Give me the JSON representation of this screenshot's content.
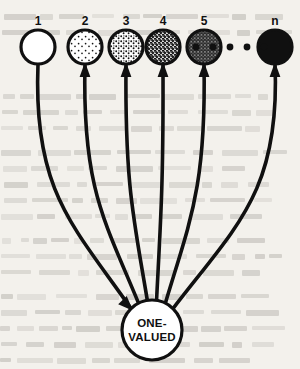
{
  "figure": {
    "background_color": "#f3f1ec",
    "ink_color": "#101010",
    "width": 300,
    "height": 369
  },
  "center_node": {
    "name": "one-valued-node",
    "label_line1": "ONE-",
    "label_line2": "VALUED",
    "cx": 152,
    "cy": 330,
    "r": 30,
    "fill": "#ffffff"
  },
  "ellipsis": {
    "name": "ellipsis-dots",
    "count": 5,
    "dot_radius": 3.4,
    "cy": 47,
    "xs": [
      196,
      213,
      230,
      247,
      264
    ]
  },
  "nodes": [
    {
      "label": "1",
      "cx": 38,
      "cy": 47,
      "r": 17,
      "shade": 0,
      "fill": "#ffffff",
      "arrow_at_node": false,
      "arrow_at_center": true
    },
    {
      "label": "2",
      "cx": 85,
      "cy": 47,
      "r": 17,
      "shade": 1,
      "fill": "#f2efe8",
      "arrow_at_node": true,
      "arrow_at_center": false
    },
    {
      "label": "3",
      "cx": 126,
      "cy": 47,
      "r": 17,
      "shade": 2,
      "fill": "#cfcabe",
      "arrow_at_node": true,
      "arrow_at_center": false
    },
    {
      "label": "4",
      "cx": 163,
      "cy": 47,
      "r": 17,
      "shade": 3,
      "fill": "#8d877c",
      "arrow_at_node": true,
      "arrow_at_center": false
    },
    {
      "label": "5",
      "cx": 204,
      "cy": 47,
      "r": 17,
      "shade": 4,
      "fill": "#4a463f",
      "arrow_at_node": true,
      "arrow_at_center": false
    },
    {
      "label": "n",
      "cx": 275,
      "cy": 47,
      "r": 17,
      "shade": 5,
      "fill": "#101010",
      "arrow_at_node": true,
      "arrow_at_center": false
    }
  ],
  "chart_data": {
    "type": "diagram",
    "node_labels": [
      "1",
      "2",
      "3",
      "4",
      "5",
      "n"
    ],
    "node_shade_levels": [
      0,
      1,
      2,
      3,
      4,
      5
    ],
    "shade_meaning": "stipple density increases from empty (1) to solid black (n)",
    "target_label": "ONE-VALUED",
    "edge_count": 6,
    "edges": [
      {
        "from": "ONE-VALUED",
        "to": "1",
        "arrowhead": "at-center"
      },
      {
        "from": "ONE-VALUED",
        "to": "2",
        "arrowhead": "at-node"
      },
      {
        "from": "ONE-VALUED",
        "to": "3",
        "arrowhead": "at-node"
      },
      {
        "from": "ONE-VALUED",
        "to": "4",
        "arrowhead": "at-node"
      },
      {
        "from": "ONE-VALUED",
        "to": "5",
        "arrowhead": "at-node"
      },
      {
        "from": "ONE-VALUED",
        "to": "n",
        "arrowhead": "at-node"
      }
    ],
    "ellipsis_between": [
      "5",
      "n"
    ]
  }
}
